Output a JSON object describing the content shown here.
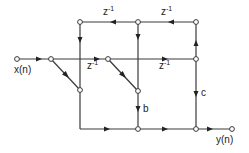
{
  "diagram": {
    "type": "signal-flow-graph",
    "input_label": "x(n)",
    "output_label": "y(n)",
    "delay_label": "z",
    "delay_exponent": "-1",
    "gain_b": "b",
    "gain_c": "c",
    "colors": {
      "line": "#3a3a3a",
      "node_fill": "#ffffff",
      "text": "#222222"
    }
  }
}
